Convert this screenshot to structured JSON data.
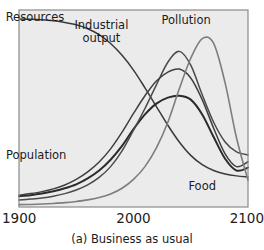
{
  "chart_data": {
    "type": "line",
    "title": "",
    "caption": "(a) Business as usual",
    "xlabel": "",
    "ylabel": "",
    "xlim": [
      1900,
      2100
    ],
    "ylim": [
      0,
      1
    ],
    "grid": false,
    "legend_position": "inline-labels",
    "x_ticks": [
      "1900",
      "2000",
      "2100"
    ],
    "x_tick_values": [
      1900,
      2000,
      2100
    ],
    "y_ticks": [],
    "plot_background": "#ebebeb",
    "frame_color": "#8a8a8a",
    "x": [
      1900,
      1910,
      1920,
      1930,
      1940,
      1950,
      1960,
      1970,
      1980,
      1990,
      2000,
      2010,
      2020,
      2030,
      2040,
      2050,
      2060,
      2070,
      2080,
      2090,
      2100
    ],
    "series": [
      {
        "name": "Resources",
        "label": "Resources",
        "color": "#3a3a3a",
        "width": 1.5,
        "label_x": 1914,
        "label_y": 0.945,
        "values": [
          0.955,
          0.953,
          0.95,
          0.945,
          0.937,
          0.925,
          0.905,
          0.875,
          0.83,
          0.77,
          0.695,
          0.605,
          0.51,
          0.415,
          0.33,
          0.262,
          0.215,
          0.185,
          0.168,
          0.158,
          0.152
        ]
      },
      {
        "name": "Population",
        "label": "Population",
        "color": "#2b2b2b",
        "width": 2.0,
        "label_x": 1915,
        "label_y": 0.245,
        "values": [
          0.055,
          0.06,
          0.068,
          0.08,
          0.095,
          0.115,
          0.145,
          0.185,
          0.24,
          0.31,
          0.395,
          0.47,
          0.525,
          0.555,
          0.565,
          0.545,
          0.47,
          0.355,
          0.245,
          0.185,
          0.2
        ]
      },
      {
        "name": "Industrial output",
        "label": "Industrial output",
        "color": "#4a4a4a",
        "width": 1.5,
        "label_x": 1972,
        "label_y": 0.905,
        "values": [
          0.035,
          0.04,
          0.046,
          0.055,
          0.068,
          0.086,
          0.112,
          0.15,
          0.205,
          0.285,
          0.39,
          0.5,
          0.62,
          0.735,
          0.79,
          0.72,
          0.57,
          0.43,
          0.33,
          0.28,
          0.265
        ]
      },
      {
        "name": "Food",
        "label": "Food",
        "color": "#3f3f3f",
        "width": 1.5,
        "label_x": 2060,
        "label_y": 0.085,
        "values": [
          0.06,
          0.068,
          0.078,
          0.092,
          0.112,
          0.14,
          0.178,
          0.228,
          0.295,
          0.38,
          0.475,
          0.565,
          0.64,
          0.685,
          0.7,
          0.655,
          0.545,
          0.4,
          0.27,
          0.205,
          0.23
        ]
      },
      {
        "name": "Pollution",
        "label": "Pollution",
        "color": "#7d7d7d",
        "width": 1.6,
        "label_x": 2046,
        "label_y": 0.93,
        "values": [
          0.012,
          0.013,
          0.015,
          0.018,
          0.022,
          0.028,
          0.036,
          0.048,
          0.066,
          0.095,
          0.14,
          0.205,
          0.3,
          0.43,
          0.6,
          0.755,
          0.855,
          0.83,
          0.63,
          0.35,
          0.135
        ]
      }
    ]
  }
}
